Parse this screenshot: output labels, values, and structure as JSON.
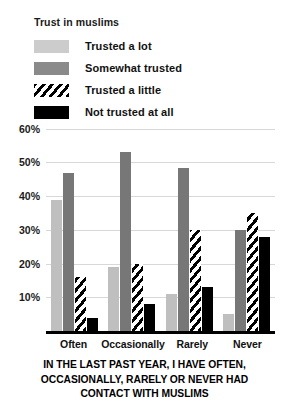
{
  "legend": {
    "title": "Trust in muslims",
    "items": [
      {
        "label": "Trusted a lot",
        "swatch": "light-gray-swatch",
        "color": "#cccccc"
      },
      {
        "label": "Somewhat trusted",
        "swatch": "medium-gray-swatch",
        "color": "#8a8a8a"
      },
      {
        "label": "Trusted a little",
        "swatch": "hatched-swatch",
        "color": "#ffffff"
      },
      {
        "label": "Not trusted at all",
        "swatch": "black-swatch",
        "color": "#000000"
      }
    ]
  },
  "axes": {
    "y_ticks": [
      "60%",
      "50%",
      "40%",
      "30%",
      "20%",
      "10%"
    ],
    "x_ticks": [
      "Often",
      "Occasionally",
      "Rarely",
      "Never"
    ]
  },
  "caption": {
    "line1": "IN THE LAST PAST YEAR, I HAVE OFTEN,",
    "line2": "OCCASIONALLY, RARELY OR NEVER HAD",
    "line3": "CONTACT WITH MUSLIMS"
  },
  "chart_data": {
    "type": "bar",
    "title": "Trust in muslims",
    "xlabel": "IN THE LAST PAST YEAR, I HAVE OFTEN, OCCASIONALLY, RARELY OR NEVER HAD CONTACT WITH MUSLIMS",
    "ylabel": "",
    "ylim": [
      0,
      62
    ],
    "ytick_values": [
      60,
      50,
      40,
      30,
      20,
      10
    ],
    "ytick_labels": [
      "60%",
      "50%",
      "40%",
      "30%",
      "20%",
      "10%"
    ],
    "grid": true,
    "legend_position": "top-left",
    "categories": [
      "Often",
      "Occasionally",
      "Rarely",
      "Never"
    ],
    "series": [
      {
        "name": "Trusted a lot",
        "color": "#bfbfbf",
        "values": [
          39,
          19,
          11,
          5
        ]
      },
      {
        "name": "Somewhat trusted",
        "color": "#777777",
        "values": [
          47,
          53,
          48.5,
          30
        ]
      },
      {
        "name": "Trusted a little",
        "color": "#ffffff",
        "pattern": "diagonal-hatch",
        "values": [
          16,
          20,
          30,
          35
        ]
      },
      {
        "name": "Not trusted at all",
        "color": "#000000",
        "values": [
          4,
          8,
          13,
          28
        ]
      }
    ]
  }
}
